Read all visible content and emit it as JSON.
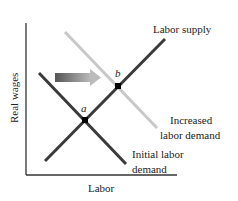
{
  "diagram": {
    "type": "supply-demand",
    "axes": {
      "x_label": "Labor",
      "y_label": "Real wages"
    },
    "curves": [
      {
        "id": "labor-supply",
        "label": "Labor supply",
        "color": "#3a3a3a"
      },
      {
        "id": "initial-labor-demand",
        "label_line1": "Initial labor",
        "label_line2": "demand",
        "color": "#3a3a3a"
      },
      {
        "id": "increased-labor-demand",
        "label_line1": "Increased",
        "label_line2": "labor demand",
        "color": "#c8c8c8"
      }
    ],
    "points": [
      {
        "id": "a",
        "label": "a"
      },
      {
        "id": "b",
        "label": "b"
      }
    ],
    "arrow": {
      "direction": "right",
      "meaning": "demand shift"
    }
  }
}
